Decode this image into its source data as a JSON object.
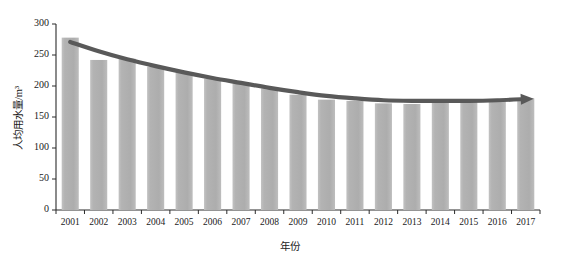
{
  "chart_data": {
    "type": "bar",
    "title": "",
    "subtitle": "",
    "xlabel": "年份",
    "ylabel": "人均用水量/m³",
    "categories": [
      "2001",
      "2002",
      "2003",
      "2004",
      "2005",
      "2006",
      "2007",
      "2008",
      "2009",
      "2010",
      "2011",
      "2012",
      "2013",
      "2014",
      "2015",
      "2016",
      "2017"
    ],
    "values": [
      278,
      242,
      244,
      231,
      222,
      212,
      204,
      196,
      186,
      178,
      176,
      172,
      171,
      176,
      177,
      178,
      180
    ],
    "series": [
      {
        "name": "人均用水量",
        "type": "bar",
        "values": [
          278,
          242,
          244,
          231,
          222,
          212,
          204,
          196,
          186,
          178,
          176,
          172,
          171,
          176,
          177,
          178,
          180
        ]
      },
      {
        "name": "趋势线",
        "type": "line",
        "values": [
          271,
          256,
          243,
          232,
          222,
          213,
          205,
          197,
          190,
          184,
          180,
          177,
          176,
          176,
          176,
          177,
          179
        ]
      }
    ],
    "ylim": [
      0,
      300
    ],
    "yticks": [
      0,
      50,
      100,
      150,
      200,
      250,
      300
    ],
    "ytick_labels": [
      "0",
      "50",
      "100",
      "150",
      "200",
      "250",
      "300"
    ],
    "xtick_labels": [
      "2001",
      "2002",
      "2003",
      "2004",
      "2005",
      "2006",
      "2007",
      "2008",
      "2009",
      "2010",
      "2011",
      "2012",
      "2013",
      "2014",
      "2015",
      "2016",
      "2017"
    ],
    "grid": false,
    "legend": null,
    "annotations": [
      {
        "name": "trend-arrowhead",
        "text": "",
        "shape": "right-arrow"
      }
    ],
    "colors": {
      "bar_fill": "#b5b5b5",
      "bar_fill_light": "#cfcfcf",
      "trend_line": "#595959",
      "axis": "#2b2b2b",
      "text": "#1a1a1a",
      "background": "#ffffff"
    }
  }
}
